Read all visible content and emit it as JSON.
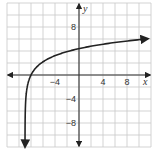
{
  "chart_data": {
    "type": "line",
    "title": "",
    "xlabel": "x",
    "ylabel": "y",
    "xlim": [
      -12,
      12
    ],
    "ylim": [
      -12,
      12
    ],
    "grid": true,
    "grid_step": 2,
    "x_tick_labels": [
      {
        "value": -4,
        "label": "−4"
      },
      {
        "value": 4,
        "label": "4"
      },
      {
        "value": 8,
        "label": "8"
      }
    ],
    "y_tick_labels": [
      {
        "value": 8,
        "label": "8"
      },
      {
        "value": -4,
        "label": "−4"
      },
      {
        "value": -8,
        "label": "−8"
      }
    ],
    "series": [
      {
        "name": "curve",
        "description": "logarithmic curve with vertical asymptote near x = -9, arrows at both ends",
        "x": [
          -8.95,
          -8.9,
          -8.8,
          -8.6,
          -8.3,
          -8,
          -7.5,
          -7,
          -6,
          -5,
          -4,
          -2,
          0,
          2,
          4,
          6,
          8,
          10,
          11.5
        ],
        "y": [
          -11.98,
          -8.8,
          -6.8,
          -4.8,
          -3.1,
          0.0,
          0.81,
          1.39,
          2.2,
          2.77,
          3.22,
          3.91,
          4.39,
          4.8,
          5.13,
          5.42,
          5.67,
          5.89,
          6.05
        ]
      }
    ],
    "colors": {
      "grid": "#c8c8c8",
      "axis": "#333333",
      "curve": "#222222"
    }
  }
}
